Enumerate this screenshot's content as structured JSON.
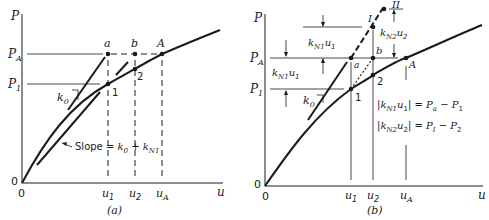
{
  "figure": {
    "panel_a": {
      "caption": "(a)",
      "y_axis_label": "P",
      "x_axis_label": "u",
      "origin_y": "0",
      "origin_x": "0",
      "y_ticks": {
        "PA": "P",
        "PA_sub": "A",
        "P1": "P",
        "P1_sub": "1"
      },
      "x_ticks": {
        "u1": "u",
        "u1_sub": "1",
        "u2": "u",
        "u2_sub": "2",
        "uA": "u",
        "uA_sub": "A"
      },
      "points": {
        "a": "a",
        "b": "b",
        "A": "A",
        "p1": "1",
        "p2": "2"
      },
      "k0_label": "k",
      "k0_sub": "0",
      "slope_label": "Slope = ",
      "slope_k0": "k",
      "slope_k0_sub": "0",
      "slope_plus": " + ",
      "slope_kN1": "k",
      "slope_kN1_sub": "N1"
    },
    "panel_b": {
      "caption": "(b)",
      "y_axis_label": "P",
      "x_axis_label": "u",
      "origin_y": "0",
      "origin_x": "0",
      "y_ticks": {
        "PA": "P",
        "PA_sub": "A",
        "P1": "P",
        "P1_sub": "1"
      },
      "x_ticks": {
        "u1": "u",
        "u1_sub": "1",
        "u2": "u",
        "u2_sub": "2",
        "uA": "u",
        "uA_sub": "A"
      },
      "points": {
        "a": "a",
        "b": "b",
        "A": "A",
        "I": "I",
        "II": "II",
        "p1": "1",
        "p2": "2"
      },
      "k0_label": "k",
      "k0_sub": "0",
      "dim_left": {
        "k": "k",
        "sub": "N1",
        "u": "u",
        "usub": "1"
      },
      "dim_upper": {
        "k": "k",
        "sub": "N1",
        "u": "u",
        "usub": "1"
      },
      "dim_right": {
        "k": "k",
        "sub": "N2",
        "u": "u",
        "usub": "2"
      },
      "eq1": {
        "bar_open": "|",
        "k": "k",
        "ksub": "N1",
        "u": "u",
        "usub": "1",
        "bar_close": "|",
        "eq": " = ",
        "Pa": "P",
        "Pa_sub": "a",
        "minus": " − ",
        "P1": "P",
        "P1_sub": "1"
      },
      "eq2": {
        "bar_open": "|",
        "k": "k",
        "ksub": "N2",
        "u": "u",
        "usub": "2",
        "bar_close": "|",
        "eq": " = ",
        "PI": "P",
        "PI_sub": "I",
        "minus": " − ",
        "P2": "P",
        "P2_sub": "2"
      }
    }
  }
}
